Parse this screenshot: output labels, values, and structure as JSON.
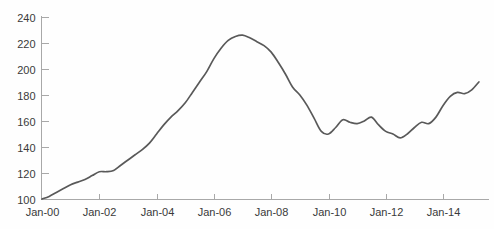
{
  "chart_data": {
    "type": "line",
    "title": "",
    "subtitle": "",
    "xlabel": "",
    "ylabel": "",
    "grid": false,
    "legend_position": "none",
    "xlim": [
      2000.0,
      2015.4
    ],
    "ylim": [
      95,
      245
    ],
    "y_ticks": [
      100,
      120,
      140,
      160,
      180,
      200,
      220,
      240
    ],
    "y_tick_labels": [
      "100",
      "120",
      "140",
      "160",
      "180",
      "200",
      "220",
      "240"
    ],
    "x_ticks": [
      2000,
      2002,
      2004,
      2006,
      2008,
      2010,
      2012,
      2014
    ],
    "x_tick_labels": [
      "Jan-00",
      "Jan-02",
      "Jan-04",
      "Jan-06",
      "Jan-08",
      "Jan-10",
      "Jan-12",
      "Jan-14"
    ],
    "series": [
      {
        "name": "Index",
        "color": "#595959",
        "x": [
          2000.0,
          2000.25,
          2000.5,
          2000.75,
          2001.0,
          2001.25,
          2001.5,
          2001.75,
          2002.0,
          2002.25,
          2002.5,
          2002.75,
          2003.0,
          2003.25,
          2003.5,
          2003.75,
          2004.0,
          2004.25,
          2004.5,
          2004.75,
          2005.0,
          2005.25,
          2005.5,
          2005.75,
          2006.0,
          2006.25,
          2006.5,
          2006.75,
          2007.0,
          2007.25,
          2007.5,
          2007.75,
          2008.0,
          2008.25,
          2008.5,
          2008.75,
          2009.0,
          2009.25,
          2009.5,
          2009.75,
          2010.0,
          2010.25,
          2010.5,
          2010.75,
          2011.0,
          2011.25,
          2011.5,
          2011.75,
          2012.0,
          2012.25,
          2012.5,
          2012.75,
          2013.0,
          2013.25,
          2013.5,
          2013.75,
          2014.0,
          2014.25,
          2014.5,
          2014.75,
          2015.0,
          2015.25
        ],
        "y": [
          100,
          102,
          105,
          108,
          111,
          113,
          115,
          118,
          121,
          121,
          122,
          126,
          130,
          134,
          138,
          143,
          150,
          157,
          163,
          168,
          174,
          182,
          190,
          198,
          208,
          216,
          222,
          225,
          226,
          224,
          221,
          218,
          213,
          205,
          196,
          186,
          180,
          172,
          162,
          152,
          150,
          155,
          161,
          159,
          158,
          160,
          163,
          157,
          152,
          150,
          147,
          150,
          155,
          159,
          158,
          163,
          172,
          179,
          182,
          181,
          184,
          190
        ]
      }
    ]
  },
  "axis": {
    "line_color": "#a8a8a8",
    "tick_color": "#a8a8a8",
    "label_color": "#3a3a3a"
  },
  "background": {
    "color": "#fefefe"
  }
}
